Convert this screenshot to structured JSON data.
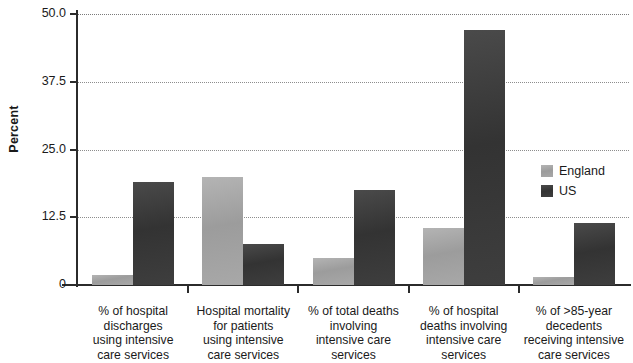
{
  "chart_data": {
    "type": "bar",
    "title": "",
    "xlabel": "",
    "ylabel": "Percent",
    "ylim": [
      0,
      50
    ],
    "yticks": [
      0,
      12.5,
      25.0,
      37.5,
      50.0
    ],
    "ytick_labels": [
      "0",
      "12.5",
      "25.0",
      "37.5",
      "50.0"
    ],
    "grid": true,
    "legend_position": "center right",
    "categories": [
      "% of hospital\ndischarges\nusing intensive\ncare services",
      "Hospital mortality\nfor patients\nusing intensive\ncare services",
      "% of total deaths\ninvolving\nintensive care\nservices",
      "% of hospital\ndeaths involving\nintensive care\nservices",
      "% of >85-year\ndecedents\nreceiving intensive\ncare services"
    ],
    "series": [
      {
        "name": "England",
        "color": "#a4a4a4",
        "values": [
          1.8,
          20.0,
          5.0,
          10.5,
          1.5
        ]
      },
      {
        "name": "US",
        "color": "#383838",
        "values": [
          19.0,
          7.5,
          17.5,
          47.0,
          11.5
        ]
      }
    ]
  },
  "legend": {
    "entries": [
      {
        "label": "England"
      },
      {
        "label": "US"
      }
    ]
  },
  "axis": {
    "y_title": "Percent"
  }
}
